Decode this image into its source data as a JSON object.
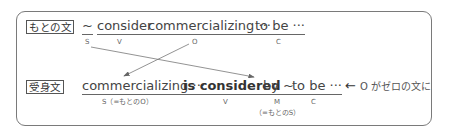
{
  "original": {
    "tag": "もとの文",
    "words": [
      "~",
      "consider",
      "commercializing ···",
      "to be ···"
    ],
    "labels": [
      "S",
      "V",
      "O",
      "C"
    ]
  },
  "passive": {
    "tag": "受身文",
    "words": [
      "commercializing ···",
      "is considered",
      "by ~",
      "to be ···"
    ],
    "labels": [
      "S（=もとのO）",
      "V",
      "M",
      "C"
    ],
    "sub_label": "（=もとのS）",
    "note": "O がゼロの文に",
    "note_arrow": "←"
  },
  "colors": {
    "frame": "#7a7a7a",
    "line": "#666666",
    "text": "#444444"
  }
}
